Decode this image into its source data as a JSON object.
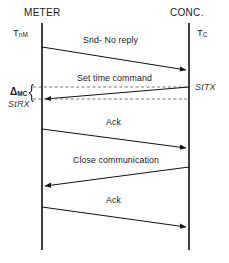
{
  "diagram": {
    "type": "sequence-diagram",
    "title": "",
    "background_color": "#ffffff",
    "line_color": "#1a1a1a",
    "dashed_color": "#555555",
    "actors": [
      {
        "id": "meter",
        "name": "METER",
        "time_label": "T",
        "time_subscript": "nM",
        "lifeline_x": 42
      },
      {
        "id": "conc",
        "name": "CONC.",
        "time_label": "T",
        "time_subscript": "C",
        "lifeline_x": 189
      }
    ],
    "messages": [
      {
        "label": "Snd- No reply",
        "from": "meter",
        "to": "conc",
        "direction": "right",
        "y_start": 47,
        "y_end": 70
      },
      {
        "label": "Set time command",
        "from": "conc",
        "to": "meter",
        "direction": "left",
        "y_start": 87,
        "y_end": 99
      },
      {
        "label": "Ack",
        "from": "meter",
        "to": "conc",
        "direction": "right",
        "y_start": 129,
        "y_end": 148
      },
      {
        "label": "Close communication",
        "from": "conc",
        "to": "meter",
        "direction": "left",
        "y_start": 167,
        "y_end": 186
      },
      {
        "label": "Ack",
        "from": "meter",
        "to": "conc",
        "direction": "right",
        "y_start": 207,
        "y_end": 227
      }
    ],
    "annotations": {
      "tx_stamp": "StTX",
      "rx_stamp": "StRX",
      "interval_label": "Δ",
      "interval_subscript": "MC"
    }
  }
}
